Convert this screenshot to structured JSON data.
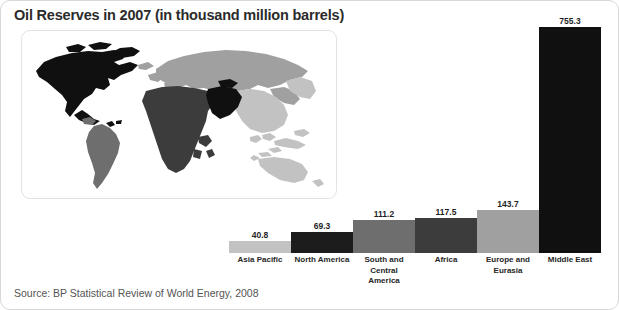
{
  "figure": {
    "title": "Oil Reserves in 2007 (in thousand million barrels)",
    "source": "Source: BP Statistical Review of World Energy, 2008"
  },
  "map": {
    "name": "world-choropleth",
    "regions": [
      {
        "name": "North America",
        "color": "#101010"
      },
      {
        "name": "South and Central America",
        "color": "#6e6e6e"
      },
      {
        "name": "Europe and Eurasia",
        "color": "#a0a0a0"
      },
      {
        "name": "Africa",
        "color": "#3c3c3c"
      },
      {
        "name": "Middle East",
        "color": "#101010"
      },
      {
        "name": "Asia Pacific",
        "color": "#c2c2c2"
      }
    ]
  },
  "chart_data": {
    "type": "bar",
    "title": "Oil Reserves in 2007 (in thousand million barrels)",
    "xlabel": "",
    "ylabel": "Thousand million barrels",
    "ylim": [
      0,
      800
    ],
    "grid": false,
    "legend": "none",
    "categories": [
      "Asia Pacific",
      "North America",
      "South and Central America",
      "Africa",
      "Europe and Eurasia",
      "Middle East"
    ],
    "values": [
      40.8,
      69.3,
      111.2,
      117.5,
      143.7,
      755.3
    ],
    "value_labels": [
      "40.8",
      "69.3",
      "111.2",
      "117.5",
      "143.7",
      "755.3"
    ],
    "colors": [
      "#c2c2c2",
      "#1c1c1c",
      "#6e6e6e",
      "#3c3c3c",
      "#a0a0a0",
      "#101010"
    ],
    "units": "thousand million barrels",
    "source": "BP Statistical Review of World Energy, 2008"
  }
}
